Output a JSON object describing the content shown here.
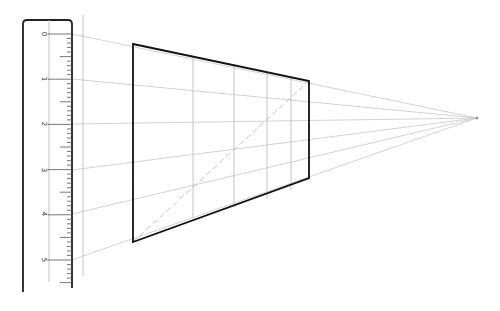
{
  "diagram": {
    "type": "one-point-perspective-construction",
    "colors": {
      "background": "#ffffff",
      "outline": "#111111",
      "ruler_edge": "#222222",
      "guide": "#c8c8c8",
      "grid": "#bdbdbd",
      "tick": "#555555"
    },
    "ruler": {
      "left": 23,
      "right": 72,
      "top": 20,
      "bottom": 292,
      "inner_line_x": 49,
      "labels": [
        "0",
        "1",
        "2",
        "3",
        "4",
        "5"
      ],
      "label_y": [
        34,
        79,
        124,
        170,
        214,
        260
      ],
      "minor_ticks_per_unit": 10
    },
    "reference_line": {
      "x": 83,
      "y1": 15,
      "y2": 276
    },
    "vanishing_point": {
      "x": 477,
      "y": 118
    },
    "trapezoid": {
      "top_left": [
        133,
        44
      ],
      "top_right": [
        309,
        81
      ],
      "bottom_right": [
        309,
        178
      ],
      "bottom_left": [
        133,
        242
      ]
    },
    "vertical_grid_lines": [
      {
        "x": 193,
        "y1": 57,
        "y2": 218
      },
      {
        "x": 234,
        "y1": 65,
        "y2": 207
      },
      {
        "x": 267,
        "y1": 72,
        "y2": 199
      },
      {
        "x": 291,
        "y1": 77,
        "y2": 190
      }
    ],
    "diagonal": {
      "from": [
        133,
        242
      ],
      "to": [
        309,
        81
      ]
    }
  }
}
